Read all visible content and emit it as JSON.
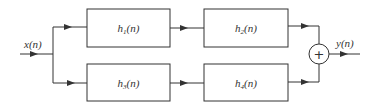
{
  "diagram": {
    "type": "block-diagram",
    "input_label": "x(n)",
    "output_label": "y(n)",
    "blocks": [
      {
        "id": "h1",
        "base": "h",
        "sub": "1",
        "arg": "(n)"
      },
      {
        "id": "h2",
        "base": "h",
        "sub": "2",
        "arg": "(n)"
      },
      {
        "id": "h3",
        "base": "h",
        "sub": "3",
        "arg": "(n)"
      },
      {
        "id": "h4",
        "base": "h",
        "sub": "4",
        "arg": "(n)"
      }
    ],
    "summer_symbol": "+",
    "connections": [
      [
        "x(n)",
        "h1"
      ],
      [
        "x(n)",
        "h3"
      ],
      [
        "h1",
        "h2"
      ],
      [
        "h3",
        "h4"
      ],
      [
        "h2",
        "sum"
      ],
      [
        "h4",
        "sum"
      ],
      [
        "sum",
        "y(n)"
      ]
    ],
    "colors": {
      "line": "#333333",
      "background": "#ffffff"
    }
  }
}
